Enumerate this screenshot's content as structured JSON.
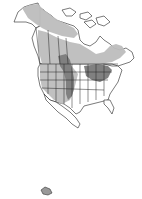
{
  "map": {
    "type": "species-range-map",
    "region": "North America",
    "colors": {
      "background": "#ffffff",
      "outline": "#222222",
      "land": "#ffffff",
      "range_light": "#bdbdbd",
      "range_dark": "#808080"
    },
    "legend": [],
    "labels": []
  }
}
